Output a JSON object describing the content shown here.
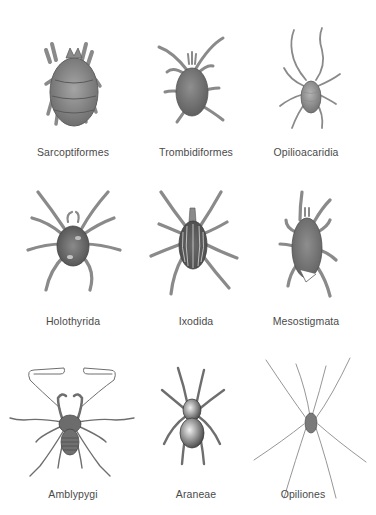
{
  "figure": {
    "rows": [
      [
        {
          "name": "Sarcoptiformes",
          "icon": "sarcoptiformes-mite-illustration"
        },
        {
          "name": "Trombidiformes",
          "icon": "trombidiformes-mite-illustration"
        },
        {
          "name": "Opilioacaridia",
          "icon": "opilioacaridia-mite-illustration"
        }
      ],
      [
        {
          "name": "Holothyrida",
          "icon": "holothyrida-mite-illustration"
        },
        {
          "name": "Ixodida",
          "icon": "ixodida-tick-illustration"
        },
        {
          "name": "Mesostigmata",
          "icon": "mesostigmata-mite-illustration"
        }
      ],
      [
        {
          "name": "Amblypygi",
          "icon": "amblypygi-whip-spider-illustration"
        },
        {
          "name": "Araneae",
          "icon": "araneae-spider-illustration"
        },
        {
          "name": "Opiliones",
          "icon": "opiliones-harvestman-illustration"
        }
      ]
    ]
  },
  "colors": {
    "background": "#ffffff",
    "label_text": "#4a4a4a",
    "illustration_gray": "#7a7a7a"
  }
}
